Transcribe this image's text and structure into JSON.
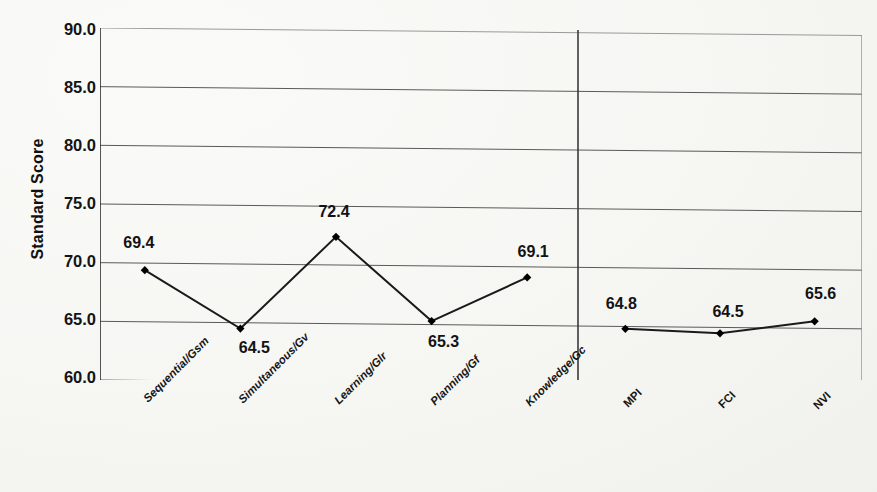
{
  "chart_data": {
    "type": "line",
    "title": "",
    "subtitle": "",
    "xlabel": "",
    "ylabel": "Standard Score",
    "ylim": [
      60.0,
      90.0
    ],
    "yticks": [
      "90.0",
      "85.0",
      "80.0",
      "75.0",
      "70.0",
      "65.0",
      "60.0"
    ],
    "ytick_values": [
      90.0,
      85.0,
      80.0,
      75.0,
      70.0,
      65.0,
      60.0
    ],
    "grid": true,
    "legend": "none",
    "categories": [
      "Sequential/Gsm",
      "Simultaneous/Gv",
      "Learning/Glr",
      "Planning/Gf",
      "Knowledge/Gc",
      "MPI",
      "FCI",
      "NVI"
    ],
    "series": [
      {
        "name": "Standard Score",
        "values": [
          69.4,
          64.5,
          72.4,
          65.3,
          69.1,
          64.8,
          64.5,
          65.6
        ]
      }
    ],
    "point_labels": [
      "69.4",
      "64.5",
      "72.4",
      "65.3",
      "69.1",
      "64.8",
      "64.5",
      "65.6"
    ],
    "groups": [
      {
        "name": "scales",
        "categories": [
          "Sequential/Gsm",
          "Simultaneous/Gv",
          "Learning/Glr",
          "Planning/Gf",
          "Knowledge/Gc"
        ]
      },
      {
        "name": "indexes",
        "categories": [
          "MPI",
          "FCI",
          "NVI"
        ]
      }
    ],
    "separator_after_category_index": 4,
    "annotations": [],
    "colors": {
      "line": "#1a1a1a",
      "marker": "#000000",
      "grid": "#5a5a5a",
      "axis": "#2b2b2b",
      "text": "#121212",
      "background": "#fbfbfa"
    }
  },
  "axes": {
    "y_title": "Standard Score"
  }
}
